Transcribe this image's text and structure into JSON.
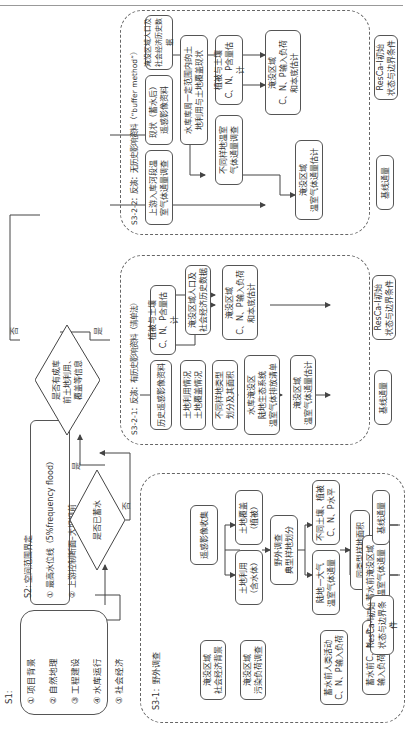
{
  "s1": {
    "title": "S1:",
    "items": [
      "① 项目背景",
      "② 自然地理",
      "③ 工程建设",
      "④ 水库运行",
      "⑤ 社会经济"
    ]
  },
  "s2": {
    "title": "S2: 空间范围界定",
    "items": [
      "① 最高水位线（5%frequency flood）",
      "② 上游控制断面–大坝坝前"
    ]
  },
  "decision1": {
    "text": "是否已蓄水",
    "yes": "是",
    "no": "否"
  },
  "decision2": {
    "text": "是否有成库\n前土地利用、\n覆盖等信息",
    "yes": "是",
    "no": "否"
  },
  "s3_1": {
    "title": "S3-1：野外调查",
    "boxes": {
      "rs_collect": "遥感影像收集",
      "landuse": "土地利用\n（含水体）",
      "landcover": "土地覆盖\n（植被）",
      "field_survey": "野外调查\n典型样地划分",
      "ghg_flux": "陆地—大气\n温室气体通量",
      "soil_veg": "不同土壤、植被\nC、N、P水平",
      "human_input": "蓄水前人类活动\nC、N、P输入负荷",
      "sample_area": "同类型样地面积",
      "socio": "淹没区域\n社会经济背景",
      "pollution": "淹没区域\n污染负荷调查",
      "cnp_load": "蓄水前C、N、P\n输入负荷和本底",
      "ghg_est": "蓄水前淹没区域\n温室气体通量"
    }
  },
  "s3_2_1": {
    "title": "S3-2-1：反演：有历史影响资料（清单法）",
    "boxes": {
      "hist_rs": "历史遥感影像资料",
      "landuse_cover": "土地利用情况\n土地覆盖情况",
      "sample_type": "不同样地类型\n划分及其面积",
      "inventory": "水库淹没区\n陆地生态系统\n温室气体排放清单",
      "veg_soil": "植被与土壤\nC、N、P含量估计",
      "socio_hist": "淹没区域人口及\n社会经济历史数据",
      "cnp_est": "淹没区域\nC、N、P输入负荷\n和本底估计",
      "ghg_est": "淹没区域\n温室气体通量估计"
    }
  },
  "s3_2_2": {
    "title": "S3-2-2：反演：无历史影响资料（“buffer method”）",
    "boxes": {
      "upstream": "上游入库河段温\n室气体通量调查",
      "current_rs": "现状（蓄水后）\n遥感影像资料",
      "buffer_land": "水库库周一定范围内的土\n地利用与土地覆盖现状",
      "socio_hist": "淹没区域人口及\n社会经济历史数据",
      "veg_soil": "植被与土壤\nC、N、P含量估计",
      "sample_ghg": "不同样地温室\n气体通量调查",
      "cnp_est": "淹没区域\nC、N、P输入负荷\n和本底估计",
      "ghg_est": "淹没区域\n温室气体通量估计"
    }
  },
  "outputs": {
    "init": "ResCa-I初始\n状态与边界条件",
    "baseline": "基线通量"
  },
  "colors": {
    "line": "#444444",
    "box_border": "#555555",
    "dashed": "#666666"
  }
}
